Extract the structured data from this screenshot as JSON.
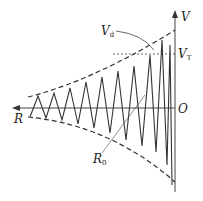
{
  "diagram": {
    "type": "waveform-envelope",
    "axes": {
      "vertical_label": "V",
      "horizontal_label": "R",
      "origin_label": "O"
    },
    "annotations": {
      "threshold": {
        "symbol": "V",
        "subscript": "T"
      },
      "peak": {
        "symbol": "V",
        "subscript": "d"
      },
      "radius": {
        "symbol": "R",
        "subscript": "0"
      }
    },
    "colors": {
      "line": "#333333",
      "background": "#ffffff"
    }
  }
}
